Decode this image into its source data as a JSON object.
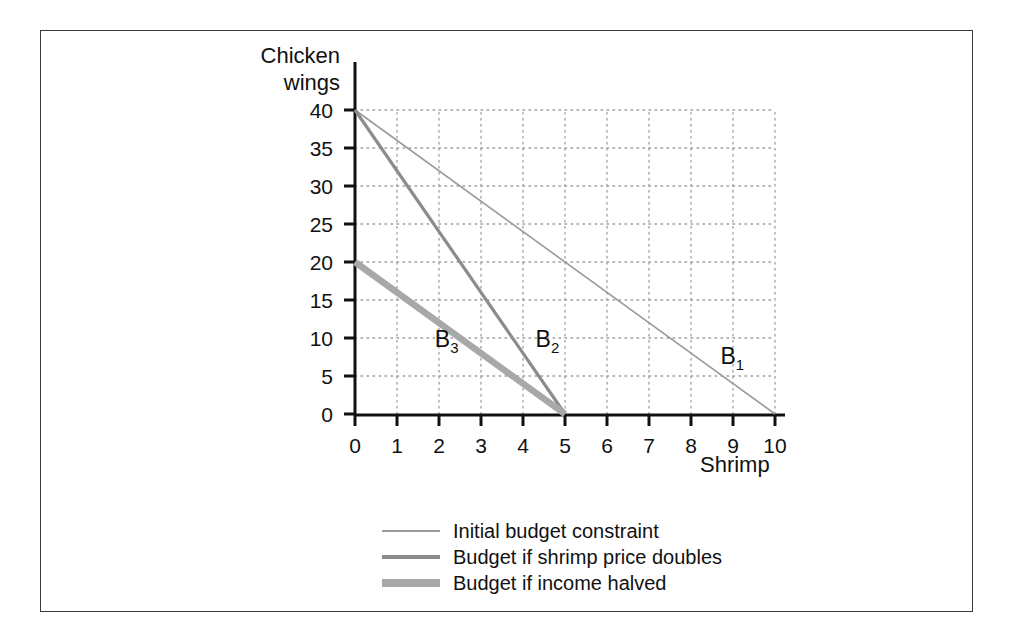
{
  "chart_data": {
    "type": "line",
    "title": "",
    "xlabel": "Shrimp",
    "ylabel": "Chicken wings",
    "xlim": [
      0,
      10
    ],
    "ylim": [
      0,
      40
    ],
    "xticks": [
      "0",
      "1",
      "2",
      "3",
      "4",
      "5",
      "6",
      "7",
      "8",
      "9",
      "10"
    ],
    "yticks": [
      "0",
      "5",
      "10",
      "15",
      "20",
      "25",
      "30",
      "35",
      "40"
    ],
    "grid": "dotted",
    "legend_position": "below-plot",
    "series": [
      {
        "name": "Initial budget constraint",
        "label": "B",
        "label_sub": "1",
        "points": [
          [
            0,
            40
          ],
          [
            10,
            0
          ]
        ],
        "color": "#9a9a9a",
        "width": 1.6
      },
      {
        "name": "Budget if shrimp price doubles",
        "label": "B",
        "label_sub": "2",
        "points": [
          [
            0,
            40
          ],
          [
            5,
            0
          ]
        ],
        "color": "#8c8c8c",
        "width": 3.2
      },
      {
        "name": "Budget if income halved",
        "label": "B",
        "label_sub": "3",
        "points": [
          [
            0,
            20
          ],
          [
            5,
            0
          ]
        ],
        "color": "#a8a8a8",
        "width": 6.5
      }
    ],
    "annotations": [
      {
        "text": "B",
        "sub": "3",
        "x": 1.9,
        "y": 9.5
      },
      {
        "text": "B",
        "sub": "2",
        "x": 4.3,
        "y": 9.5
      },
      {
        "text": "B",
        "sub": "1",
        "x": 8.7,
        "y": 7.2
      }
    ]
  },
  "legend": {
    "items": [
      {
        "label": "Initial budget constraint",
        "color": "#9a9a9a",
        "thickness": "2px"
      },
      {
        "label": "Budget if shrimp price doubles",
        "color": "#8c8c8c",
        "thickness": "4px"
      },
      {
        "label": "Budget if income halved",
        "color": "#a8a8a8",
        "thickness": "8px"
      }
    ]
  },
  "axes": {
    "y_title": "Chicken\nwings",
    "x_title": "Shrimp"
  }
}
